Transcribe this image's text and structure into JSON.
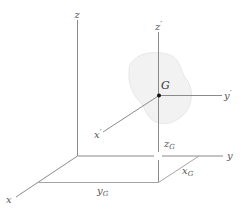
{
  "figure": {
    "colors": {
      "axis": "#8a8a8a",
      "body_fill": "#f2f2f2",
      "body_edge": "#e6e6e6",
      "point": "#111111",
      "label": "#555555"
    }
  },
  "axes": {
    "global": {
      "x": {
        "label": "x"
      },
      "y": {
        "label": "y"
      },
      "z": {
        "label": "z"
      }
    },
    "local": {
      "x": {
        "label": "x",
        "prime": "′"
      },
      "y": {
        "label": "y",
        "prime": "′"
      },
      "z": {
        "label": "z",
        "prime": "′"
      }
    }
  },
  "point": {
    "label": "G",
    "name": "center of mass"
  },
  "dimensions": {
    "xG": {
      "base": "x",
      "sub": "G"
    },
    "yG": {
      "base": "y",
      "sub": "G"
    },
    "zG": {
      "base": "z",
      "sub": "G"
    }
  }
}
